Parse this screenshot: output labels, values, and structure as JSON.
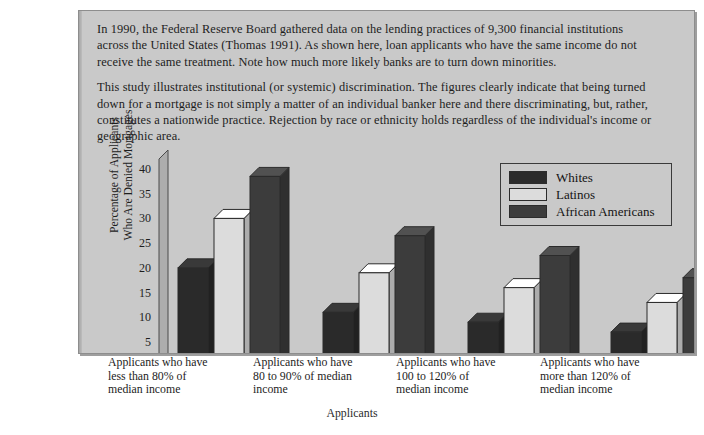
{
  "caption": {
    "paragraph1": "In 1990, the Federal Reserve Board gathered data on the lending practices of 9,300 financial institutions across the United States (Thomas 1991). As shown here, loan applicants who have the same income do not receive the same treatment. Note how much more likely banks are to turn down minorities.",
    "paragraph2": "This study illustrates institutional (or systemic) discrimination. The figures clearly indicate that being turned down for a mortgage is not simply a matter of an individual banker here and there discriminating, but, rather, constitutes a nationwide practice. Rejection by race or ethnicity holds regardless of the individual's income or geographic area."
  },
  "chart_data": {
    "type": "bar",
    "title": "",
    "xlabel": "Applicants",
    "ylabel": "Percentage of Applicants Who Are Denied Mortgages",
    "ylabel_line1": "Percentage of Applicants",
    "ylabel_line2": "Who Are Denied Mortgages",
    "categories": [
      "Applicants who have less than 80% of median income",
      "Applicants who have 80 to 90% of median income",
      "Applicants who have 100 to 120% of median income",
      "Applicants who have more than 120% of median income"
    ],
    "category_lines": [
      [
        "Applicants who have",
        "less than 80% of",
        "median income"
      ],
      [
        "Applicants who have",
        "80 to 90% of median",
        "income"
      ],
      [
        "Applicants who have",
        "100 to 120% of",
        "median income"
      ],
      [
        "Applicants who have",
        "more than 120% of",
        "median income"
      ]
    ],
    "series": [
      {
        "name": "Whites",
        "color": "#2a2a2a",
        "values": [
          20,
          11,
          9,
          7
        ]
      },
      {
        "name": "Latinos",
        "color": "#dcdcdc",
        "values": [
          30,
          19,
          16,
          13
        ]
      },
      {
        "name": "African Americans",
        "color": "#3c3c3c",
        "values": [
          38.5,
          26.5,
          22.5,
          18
        ]
      }
    ],
    "yticks": [
      5,
      10,
      15,
      20,
      25,
      30,
      35,
      40
    ],
    "ylim": [
      0,
      42
    ],
    "grid": false,
    "legend_position": "upper-right",
    "three_d": true
  },
  "legend": {
    "items": [
      {
        "label": "Whites",
        "swatch_color": "#2a2a2a"
      },
      {
        "label": "Latinos",
        "swatch_color": "#dcdcdc"
      },
      {
        "label": "African Americans",
        "swatch_color": "#3c3c3c"
      }
    ]
  },
  "colors": {
    "panel_background": "#c9c9c9",
    "page_background": "#ffffff",
    "axis": "#3a3a3a",
    "text": "#1d1d1d"
  }
}
